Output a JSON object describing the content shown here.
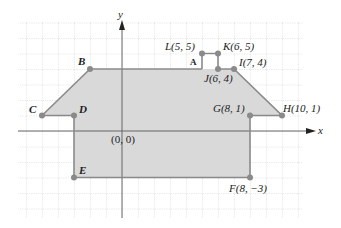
{
  "diagram": {
    "type": "coordinate-plane-polygon",
    "axes": {
      "x_label": "x",
      "y_label": "y",
      "origin_label": "(0, 0)"
    },
    "colors": {
      "fill": "#d9d9d9",
      "edge": "#8a8a8a",
      "grid": "#bdbdbd",
      "axis": "#555555",
      "point": "#8a8a8a"
    },
    "region_label": "A",
    "points": [
      {
        "name": "B",
        "label": "B",
        "x": -2,
        "y": 4
      },
      {
        "name": "C",
        "label": "C",
        "x": -5,
        "y": 1
      },
      {
        "name": "D",
        "label": "D",
        "x": -3,
        "y": 1
      },
      {
        "name": "E",
        "label": "E",
        "x": -3,
        "y": -3
      },
      {
        "name": "F",
        "label": "F(8, −3)",
        "x": 8,
        "y": -3
      },
      {
        "name": "G",
        "label": "G(8, 1)",
        "x": 8,
        "y": 1
      },
      {
        "name": "H",
        "label": "H(10, 1)",
        "x": 10,
        "y": 1
      },
      {
        "name": "I",
        "label": "I(7, 4)",
        "x": 7,
        "y": 4
      },
      {
        "name": "J",
        "label": "J(6, 4)",
        "x": 6,
        "y": 4
      },
      {
        "name": "K",
        "label": "K(6, 5)",
        "x": 6,
        "y": 5
      },
      {
        "name": "L",
        "label": "L(5, 5)",
        "x": 5,
        "y": 5
      }
    ]
  },
  "labels": {
    "B": "B",
    "C": "C",
    "D": "D",
    "E": "E",
    "F": "F(8, −3)",
    "G": "G(8, 1)",
    "H": "H(10, 1)",
    "I": "I(7, 4)",
    "J": "J(6, 4)",
    "K": "K(6, 5)",
    "L": "L(5, 5)",
    "A": "A",
    "origin": "(0, 0)",
    "x_axis": "x",
    "y_axis": "y"
  }
}
